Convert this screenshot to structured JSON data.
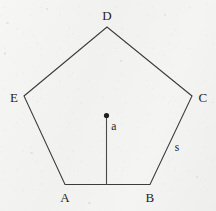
{
  "figure": {
    "shape": "pentagon",
    "canvas": {
      "width": 216,
      "height": 211
    },
    "style": {
      "background_color": "#f3f3f1",
      "stroke_color": "#3c3c3c",
      "label_color": "#242424",
      "dot_color": "#1e1e1e",
      "stroke_width": 1.1
    },
    "center_point": {
      "x": 106.5,
      "y": 115.5,
      "radius": 2.6
    },
    "apothem_segment": {
      "x1": 106.5,
      "y1": 115.5,
      "x2": 106.5,
      "y2": 184.5
    },
    "vertices": [
      {
        "id": "A",
        "x": 65,
        "y": 184.5
      },
      {
        "id": "B",
        "x": 150,
        "y": 184.5
      },
      {
        "id": "C",
        "x": 192,
        "y": 96
      },
      {
        "id": "D",
        "x": 107,
        "y": 27
      },
      {
        "id": "E",
        "x": 24,
        "y": 96
      }
    ],
    "vertex_labels": [
      {
        "id": "A",
        "text": "A",
        "x": 65,
        "y": 197
      },
      {
        "id": "B",
        "text": "B",
        "x": 150,
        "y": 197
      },
      {
        "id": "C",
        "text": "C",
        "x": 203,
        "y": 97
      },
      {
        "id": "D",
        "text": "D",
        "x": 107,
        "y": 15
      },
      {
        "id": "E",
        "text": "E",
        "x": 14,
        "y": 97
      }
    ],
    "measure_labels": [
      {
        "id": "apothem",
        "text": "a",
        "x": 114,
        "y": 127
      },
      {
        "id": "side",
        "text": "s",
        "x": 177,
        "y": 148
      }
    ]
  }
}
